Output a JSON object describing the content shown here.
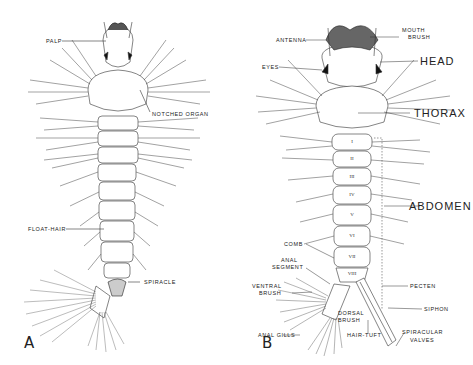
{
  "figure": {
    "panels": [
      {
        "id": "A",
        "label": "A",
        "labels": {
          "palp": "PALP",
          "notched_organ": "NOTCHED ORGAN",
          "float_hair": "FLOAT-HAIR",
          "spiracle": "SPIRACLE"
        }
      },
      {
        "id": "B",
        "label": "B",
        "labels": {
          "antenna": "ANTENNA",
          "mouth_brush_1": "MOUTH",
          "mouth_brush_2": "BRUSH",
          "eyes": "EYES",
          "head": "HEAD",
          "thorax": "THORAX",
          "abdomen": "ABDOMEN",
          "comb": "COMB",
          "anal_segment_1": "ANAL",
          "anal_segment_2": "SEGMENT",
          "ventral_brush_1": "VENTRAL",
          "ventral_brush_2": "BRUSH",
          "pecten": "PECTEN",
          "siphon": "SIPHON",
          "dorsal_brush_1": "DORSAL",
          "dorsal_brush_2": "BRUSH",
          "anal_gills": "ANAL GILLS",
          "hair_tuft": "HAIR-TUFT",
          "spiracular_valves_1": "SPIRACULAR",
          "spiracular_valves_2": "VALVES"
        },
        "segments": [
          "I",
          "II",
          "III",
          "IV",
          "V",
          "VI",
          "VII",
          "VIII"
        ]
      }
    ]
  }
}
